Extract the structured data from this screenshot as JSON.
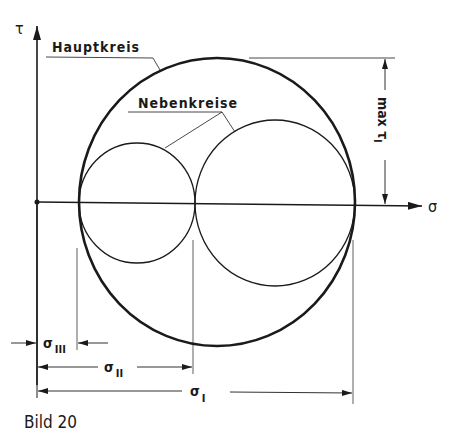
{
  "figure": {
    "caption": "Bild 20",
    "axes": {
      "x_label": "σ",
      "y_label": "τ"
    },
    "circles": {
      "main_label": "Hauptkreis",
      "secondary_label": "Nebenkreise"
    },
    "dimensions": {
      "max_tau": "max τ",
      "max_tau_sub": "I",
      "sigma_III": "σ",
      "sigma_III_sub": "III",
      "sigma_II": "σ",
      "sigma_II_sub": "II",
      "sigma_I": "σ",
      "sigma_I_sub": "I"
    },
    "colors": {
      "ink": "#1a1a1a",
      "background": "#ffffff"
    }
  }
}
